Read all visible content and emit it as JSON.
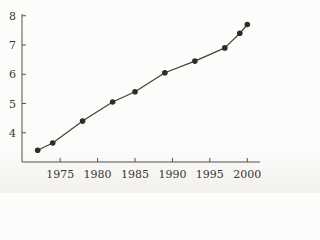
{
  "chart_data": {
    "type": "line",
    "x": [
      1972,
      1974,
      1978,
      1982,
      1985,
      1989,
      1993,
      1997,
      1999,
      2000
    ],
    "values": [
      3.4,
      3.65,
      4.4,
      5.05,
      5.4,
      6.05,
      6.45,
      6.9,
      7.4,
      7.7
    ],
    "title": "",
    "xlabel": "",
    "ylabel": "",
    "xticks": [
      1975,
      1980,
      1985,
      1990,
      1995,
      2000
    ],
    "yticks": [
      4,
      5,
      6,
      7,
      8
    ],
    "xtick_labels": [
      "1975",
      "1980",
      "1985",
      "1990",
      "1995",
      "2000"
    ],
    "ytick_labels": [
      "4",
      "5",
      "6",
      "7",
      "8"
    ],
    "xlim": [
      1969.9,
      2001.7
    ],
    "ylim": [
      3.0,
      8.06
    ],
    "grid": false,
    "legend": false,
    "marker": "filled-circle",
    "colors": {
      "line": "#44403c",
      "point": "#2e2b28",
      "axis": "#55504a",
      "tick_label": "#3a3631",
      "background": "#fcfcfa"
    }
  }
}
